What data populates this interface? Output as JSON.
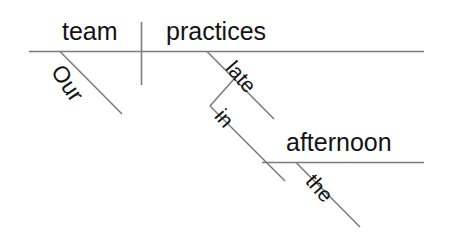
{
  "diagram": {
    "type": "sentence-diagram",
    "style": "Reed-Kellogg",
    "sentence": "Our team practices late in the afternoon.",
    "line_color": "#7d7d7d",
    "text_color": "#131313",
    "background": "#ffffff",
    "words": {
      "subject": "team",
      "subject_modifier": "Our",
      "verb": "practices",
      "verb_modifier": "late",
      "preposition": "in",
      "object_of_preposition": "afternoon",
      "object_modifier": "the"
    },
    "labels": {
      "our": "Our",
      "team": "team",
      "practices": "practices",
      "late": "late",
      "in": "in",
      "the": "the",
      "afternoon": "afternoon"
    }
  }
}
